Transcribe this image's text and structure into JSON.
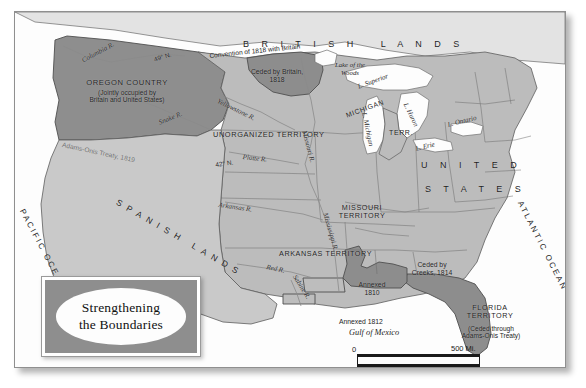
{
  "title": {
    "line1": "Strengthening",
    "line2": "the Boundaries"
  },
  "colors": {
    "us_light": "#b9b9b9",
    "spanish": "#c8c8c8",
    "highlight_dark": "#8d8d8d",
    "british": "#e2e2e2",
    "water": "#fefefe",
    "border": "#5a5a5a",
    "text": "#1d1d1d"
  },
  "regions": [
    {
      "name": "british-lands",
      "label": "B R I T I S H   L A N D S"
    },
    {
      "name": "oregon-country",
      "label": "OREGON COUNTRY",
      "sublabel": "(Jointly occupied by\nBritain and United States)"
    },
    {
      "name": "ceded-by-britain",
      "label": "Ceded by Britain,\n1818"
    },
    {
      "name": "unorganized-territory",
      "label": "UNORGANIZED TERRITORY"
    },
    {
      "name": "missouri-territory",
      "label": "MISSOURI\nTERRITORY"
    },
    {
      "name": "arkansas-territory",
      "label": "ARKANSAS TERRITORY"
    },
    {
      "name": "michigan-territory",
      "label": "MICHIGAN",
      "sublabel": "TERR."
    },
    {
      "name": "united-states",
      "label": "U N I T E D",
      "sublabel": "S T A T E S"
    },
    {
      "name": "spanish-lands",
      "label": "SPANISH LANDS"
    },
    {
      "name": "florida-territory",
      "label": "FLORIDA\nTERRITORY",
      "sublabel": "(Ceded through\nAdams-Onis Treaty)"
    },
    {
      "name": "ceded-by-creeks",
      "label": "Ceded by\nCreeks, 1814"
    },
    {
      "name": "annexed-1810",
      "label": "Annexed\n1810"
    },
    {
      "name": "annexed-1812",
      "label": "Annexed 1812"
    }
  ],
  "boundary_labels": [
    {
      "name": "convention-1818",
      "label": "Convention of 1818 with Britain"
    },
    {
      "name": "adams-onis-line",
      "label": "Adams-Onis Treaty, 1819"
    },
    {
      "name": "parallel-49",
      "label": "49° N."
    },
    {
      "name": "parallel-42",
      "label": "42° N."
    }
  ],
  "waters": [
    {
      "name": "pacific-ocean",
      "label": "PACIFIC OCEAN"
    },
    {
      "name": "atlantic-ocean",
      "label": "ATLANTIC OCEAN"
    },
    {
      "name": "gulf-of-mexico",
      "label": "Gulf of Mexico"
    },
    {
      "name": "lake-of-the-woods",
      "label": "Lake of the\nWoods"
    },
    {
      "name": "lake-superior",
      "label": "L. Superior"
    },
    {
      "name": "lake-michigan",
      "label": "L. Michigan"
    },
    {
      "name": "lake-huron",
      "label": "L. Huron"
    },
    {
      "name": "lake-erie",
      "label": "L. Erie"
    },
    {
      "name": "lake-ontario",
      "label": "L. Ontario"
    }
  ],
  "rivers": [
    {
      "name": "columbia-river",
      "label": "Columbia R."
    },
    {
      "name": "snake-river",
      "label": "Snake R."
    },
    {
      "name": "yellowstone-river",
      "label": "Yellowstone R."
    },
    {
      "name": "missouri-river",
      "label": "Missouri R."
    },
    {
      "name": "platte-river",
      "label": "Platte R."
    },
    {
      "name": "arkansas-river",
      "label": "Arkansas R."
    },
    {
      "name": "red-river",
      "label": "Red R."
    },
    {
      "name": "sabine-river",
      "label": "Sabine R."
    },
    {
      "name": "mississippi-river",
      "label": "Mississippi R."
    }
  ],
  "scale": {
    "zero_top": "0",
    "zero_bottom": "0",
    "miles": "500 Mi.",
    "kilometers": "800 Km."
  }
}
